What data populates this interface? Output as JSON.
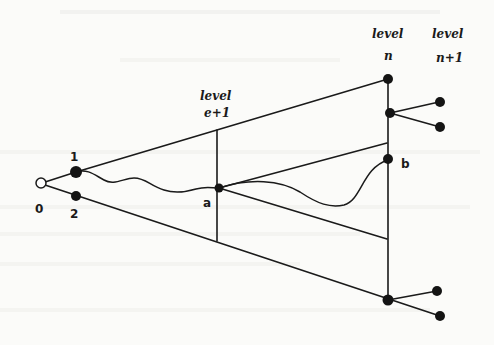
{
  "figure": {
    "ink_color": "#1a1a1a",
    "paper_color": "#fbfbf9"
  },
  "levels": [
    {
      "id": "level-e1",
      "line1": "level",
      "line2": "e+1"
    },
    {
      "id": "level-n",
      "line1": "level",
      "line2": "n"
    },
    {
      "id": "level-n1",
      "line1": "level",
      "line2": "n+1"
    }
  ],
  "nodes": {
    "root": {
      "label": "0",
      "style": "hollow"
    },
    "child1": {
      "label": "1",
      "style": "filled"
    },
    "child2": {
      "label": "2",
      "style": "filled"
    },
    "a": {
      "label": "a",
      "style": "filled"
    },
    "b": {
      "label": "b",
      "style": "filled"
    }
  }
}
